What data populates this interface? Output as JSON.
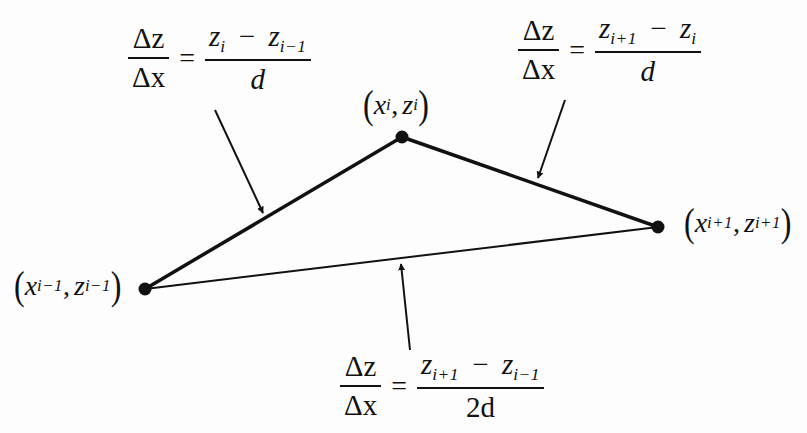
{
  "diagram": {
    "type": "finite-difference-slope-illustration",
    "colors": {
      "background": "#fdfdfd",
      "ink": "#111111"
    },
    "points": [
      {
        "id": "prev",
        "x": 145,
        "y": 289,
        "label_var": "x",
        "label_var2": "z",
        "label_sub": "i−1"
      },
      {
        "id": "curr",
        "x": 402,
        "y": 137,
        "label_var": "x",
        "label_var2": "z",
        "label_sub": "i"
      },
      {
        "id": "next",
        "x": 658,
        "y": 227,
        "label_var": "x",
        "label_var2": "z",
        "label_sub": "i+1"
      }
    ],
    "edges": [
      {
        "from": "prev",
        "to": "curr",
        "style": "thick",
        "name": "backward-difference-segment"
      },
      {
        "from": "curr",
        "to": "next",
        "style": "thick",
        "name": "forward-difference-segment"
      },
      {
        "from": "prev",
        "to": "next",
        "style": "thin",
        "name": "central-difference-segment"
      }
    ],
    "formulas": {
      "backward": {
        "lhs_num": "Δz",
        "lhs_den": "Δx",
        "equals": "=",
        "rhs_num_a": "z",
        "rhs_num_a_sub": "i",
        "minus": "−",
        "rhs_num_b": "z",
        "rhs_num_b_sub": "i−1",
        "rhs_den": "d"
      },
      "forward": {
        "lhs_num": "Δz",
        "lhs_den": "Δx",
        "equals": "=",
        "rhs_num_a": "z",
        "rhs_num_a_sub": "i+1",
        "minus": "−",
        "rhs_num_b": "z",
        "rhs_num_b_sub": "i",
        "rhs_den": "d"
      },
      "central": {
        "lhs_num": "Δz",
        "lhs_den": "Δx",
        "equals": "=",
        "rhs_num_a": "z",
        "rhs_num_a_sub": "i+1",
        "minus": "−",
        "rhs_num_b": "z",
        "rhs_num_b_sub": "i−1",
        "rhs_den": "2d"
      }
    },
    "point_labels": {
      "prev": {
        "open": "(",
        "x": "x",
        "x_sub": "i−1",
        "comma": ",",
        "z": "z",
        "z_sub": "i−1",
        "close": ")"
      },
      "curr": {
        "open": "(",
        "x": "x",
        "x_sub": "i",
        "comma": ",",
        "z": "z",
        "z_sub": "i",
        "close": ")"
      },
      "next": {
        "open": "(",
        "x": "x",
        "x_sub": "i+1",
        "comma": ",",
        "z": "z",
        "z_sub": "i+1",
        "close": ")"
      }
    },
    "arrows": [
      {
        "name": "arrow-to-backward-segment",
        "x1": 215,
        "y1": 110,
        "x2": 263,
        "y2": 213
      },
      {
        "name": "arrow-to-forward-segment",
        "x1": 565,
        "y1": 100,
        "x2": 538,
        "y2": 178
      },
      {
        "name": "arrow-to-central-segment",
        "x1": 410,
        "y1": 350,
        "x2": 401,
        "y2": 264
      }
    ]
  }
}
